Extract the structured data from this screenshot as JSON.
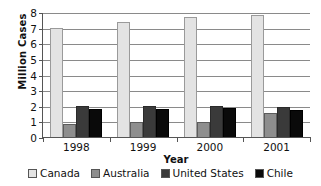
{
  "chart_data": {
    "type": "bar",
    "title": "",
    "xlabel": "Year",
    "ylabel": "Million Cases",
    "categories": [
      "1998",
      "1999",
      "2000",
      "2001"
    ],
    "ylim": [
      0,
      8
    ],
    "yticks": [
      "0",
      "1",
      "2",
      "3",
      "4",
      "5",
      "6",
      "7",
      "8"
    ],
    "grid": true,
    "legend_position": "bottom",
    "series": [
      {
        "name": "Canada",
        "color": "#e3e3e3",
        "values": [
          6.95,
          7.35,
          7.65,
          7.8
        ]
      },
      {
        "name": "Australia",
        "color": "#8e8e8e",
        "values": [
          0.85,
          0.98,
          0.98,
          1.55
        ]
      },
      {
        "name": "United States",
        "color": "#3a3a3a",
        "values": [
          2.0,
          1.98,
          1.97,
          1.95
        ]
      },
      {
        "name": "Chile",
        "color": "#0a0a0a",
        "values": [
          1.78,
          1.8,
          1.85,
          1.75
        ]
      }
    ]
  }
}
